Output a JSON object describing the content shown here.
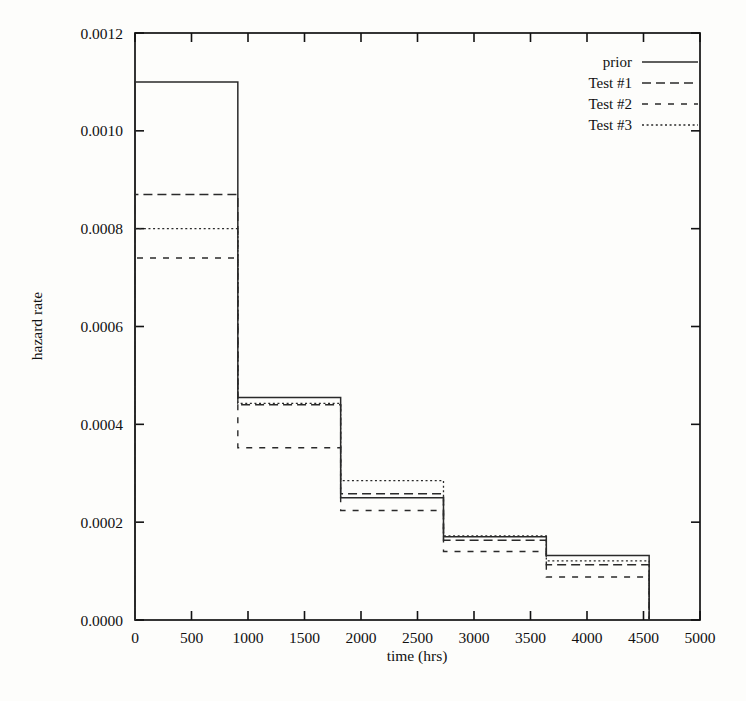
{
  "chart_data": {
    "type": "line",
    "subtype": "step",
    "title": "",
    "xlabel": "time (hrs)",
    "ylabel": "hazard rate",
    "xlim": [
      0,
      5000
    ],
    "ylim": [
      0.0,
      0.0012
    ],
    "xticks": [
      0,
      500,
      1000,
      1500,
      2000,
      2500,
      3000,
      3500,
      4000,
      4500,
      5000
    ],
    "xticklabels": [
      "0",
      "500",
      "1000",
      "1500",
      "2000",
      "2500",
      "3000",
      "3500",
      "4000",
      "4500",
      "5000"
    ],
    "yticks": [
      0.0,
      0.0002,
      0.0004,
      0.0006,
      0.0008,
      0.001,
      0.0012
    ],
    "yticklabels": [
      "0.0000",
      "0.0002",
      "0.0004",
      "0.0006",
      "0.0008",
      "0.0010",
      "0.0012"
    ],
    "grid": false,
    "legend_position": "top-right",
    "bin_edges": [
      0,
      910,
      1820,
      2730,
      3640,
      4550
    ],
    "series": [
      {
        "name": "prior",
        "style": "solid",
        "values": [
          0.0011,
          0.000455,
          0.00025,
          0.00017,
          0.000132
        ]
      },
      {
        "name": "Test #1",
        "style": "dashed",
        "values": [
          0.00087,
          0.00044,
          0.000258,
          0.000163,
          0.000113
        ]
      },
      {
        "name": "Test #2",
        "style": "dash-spaced",
        "values": [
          0.00074,
          0.000352,
          0.000224,
          0.00014,
          8.8e-05
        ]
      },
      {
        "name": "Test #3",
        "style": "dotted",
        "values": [
          0.0008,
          0.000443,
          0.000285,
          0.000172,
          0.000121
        ]
      }
    ]
  },
  "legend": {
    "entries": [
      {
        "label": "prior"
      },
      {
        "label": "Test #1"
      },
      {
        "label": "Test #2"
      },
      {
        "label": "Test #3"
      }
    ]
  }
}
